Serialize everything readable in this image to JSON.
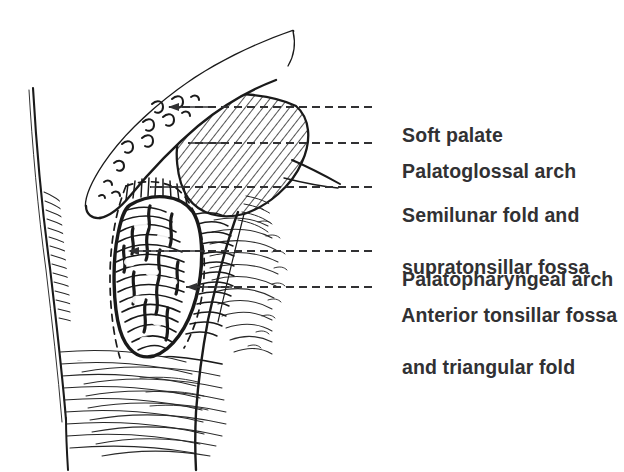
{
  "figure": {
    "background_color": "#ffffff",
    "ink_color": "#1a1a1a",
    "text_color": "#313133"
  },
  "labels": [
    {
      "id": "soft-palate",
      "text": "Soft palate",
      "x": 380,
      "y": 96
    },
    {
      "id": "palatoglossal-arch",
      "text": "Palatoglossal arch",
      "x": 380,
      "y": 132
    },
    {
      "id": "semilunar-fold",
      "text": "Semilunar fold and",
      "text_line2": "supratonsillar fossa",
      "x": 380,
      "y": 176
    },
    {
      "id": "palatopharyngeal-arch",
      "text": "Palatopharyngeal arch",
      "x": 380,
      "y": 240
    },
    {
      "id": "anterior-tonsillar-fossa",
      "text": "Anterior tonsillar fossa",
      "text_line2": "and triangular fold",
      "x": 380,
      "y": 276
    }
  ],
  "leaders": [
    {
      "id": "leader-soft-palate",
      "from_x": 372,
      "to_x": 168,
      "y": 107,
      "arrow": true
    },
    {
      "id": "leader-palatoglossal-arch",
      "from_x": 372,
      "to_x": 188,
      "y": 143,
      "arrow": false
    },
    {
      "id": "leader-semilunar-fold",
      "from_x": 372,
      "to_x": 150,
      "y": 187,
      "arrow": false
    },
    {
      "id": "leader-palatopharyngeal-arch",
      "from_x": 372,
      "to_x": 128,
      "y": 251,
      "arrow": true
    },
    {
      "id": "leader-anterior-tonsillar-fossa",
      "from_x": 372,
      "to_x": 186,
      "y": 287,
      "arrow": true
    }
  ],
  "structures": [
    {
      "id": "cheek",
      "name": "cheek-and-lip"
    },
    {
      "id": "soft-palate",
      "name": "soft-palate-with-mucous-glands"
    },
    {
      "id": "palatoglossal-arch",
      "name": "palatoglossal-arch-hatched"
    },
    {
      "id": "tonsil",
      "name": "palatine-tonsil-with-crypts"
    },
    {
      "id": "palatopharyngeal-arch",
      "name": "palatopharyngeal-arch"
    },
    {
      "id": "triangular-fold",
      "name": "triangular-fold-dashed-outline"
    },
    {
      "id": "tongue",
      "name": "tongue-dorsum"
    }
  ]
}
